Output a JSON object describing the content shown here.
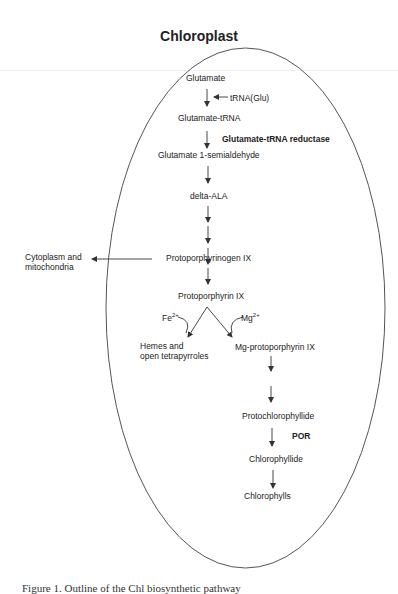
{
  "title": "Chloroplast",
  "nodes": {
    "glutamate": "Glutamate",
    "trna_glu": "tRNA(Glu)",
    "glutamate_trna": "Glutamate-tRNA",
    "enzyme_gtr": "Glutamate-tRNA reductase",
    "gsa": "Glutamate 1-semialdehyde",
    "delta_ala": "delta-ALA",
    "protoporphyrinogen": "Protoporphyrinogen IX",
    "cytoplasm_line1": "Cytoplasm and",
    "cytoplasm_line2": "mitochondria",
    "protoporphyrin": "Protoporphyrin IX",
    "fe": "Fe",
    "fe_charge": "2+",
    "mg": "Mg",
    "mg_charge": "2+",
    "hemes_line1": "Hemes and",
    "hemes_line2": "open tetrapyrroles",
    "mg_proto": "Mg-protoporphyrin IX",
    "protochlorophyllide": "Protochlorophyllide",
    "enzyme_por": "POR",
    "chlorophyllide": "Chlorophyllide",
    "chlorophylls": "Chlorophylls"
  },
  "caption": "Figure 1. Outline of the Chl biosynthetic pathway",
  "colors": {
    "line": "#333333",
    "ellipse": "#555555"
  }
}
